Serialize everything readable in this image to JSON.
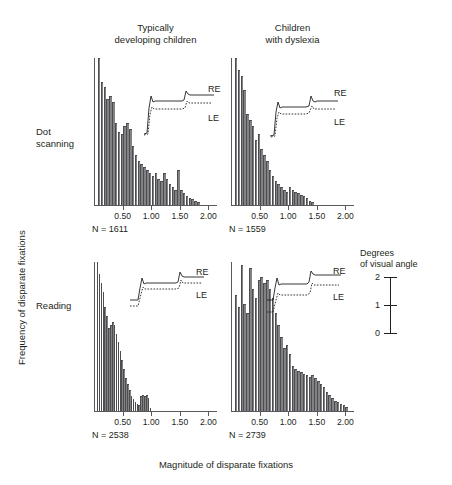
{
  "figure": {
    "y_axis_label": "Frequency of disparate fixations",
    "x_axis_label": "Magnitude of disparate fixations",
    "column_titles": [
      "Typically\ndeveloping children",
      "Children\nwith dyslexia"
    ],
    "row_labels": [
      "Dot\nscanning",
      "Reading"
    ],
    "bar_color": "#808285",
    "axis_color": "#58595b",
    "text_color": "#231f20"
  },
  "legend": {
    "title": "Degrees\nof visual angle",
    "ticks": [
      "2",
      "1",
      "0"
    ],
    "right_eye_label": "RE",
    "left_eye_label": "LE"
  },
  "chart_data": [
    {
      "type": "bar",
      "title": "Dot scanning — Typically developing children",
      "row": "Dot scanning",
      "column": "Typically developing children",
      "n_label": "N = 1611",
      "n": 1611,
      "xlabel": "Magnitude of disparate fixations",
      "ylabel": "Frequency of disparate fixations",
      "xlim": [
        0.0,
        2.15
      ],
      "xticks": [
        0.5,
        1.0,
        1.5,
        2.0
      ],
      "xticklabels": [
        "0.50",
        "1.00",
        "1.50",
        "2.00"
      ],
      "ylim": [
        0,
        100
      ],
      "grid": false,
      "bin_width": 0.05,
      "bin_starts": [
        0.05,
        0.1,
        0.15,
        0.2,
        0.25,
        0.3,
        0.35,
        0.4,
        0.45,
        0.5,
        0.55,
        0.6,
        0.65,
        0.7,
        0.75,
        0.8,
        0.85,
        0.9,
        0.95,
        1.0,
        1.05,
        1.1,
        1.15,
        1.2,
        1.25,
        1.3,
        1.35,
        1.4,
        1.45,
        1.5,
        1.55,
        1.6,
        1.65,
        1.7,
        1.75,
        1.8
      ],
      "values": [
        100,
        84,
        80,
        72,
        74,
        70,
        56,
        50,
        48,
        54,
        56,
        52,
        40,
        34,
        30,
        28,
        26,
        24,
        22,
        20,
        22,
        18,
        16,
        22,
        18,
        14,
        12,
        10,
        24,
        10,
        8,
        6,
        5,
        4,
        3,
        2
      ]
    },
    {
      "type": "bar",
      "title": "Dot scanning — Children with dyslexia",
      "row": "Dot scanning",
      "column": "Children with dyslexia",
      "n_label": "N = 1559",
      "n": 1559,
      "xlabel": "Magnitude of disparate fixations",
      "ylabel": "Frequency of disparate fixations",
      "xlim": [
        0.0,
        2.15
      ],
      "xticks": [
        0.5,
        1.0,
        1.5,
        2.0
      ],
      "xticklabels": [
        "0.50",
        "1.00",
        "1.50",
        "2.00"
      ],
      "ylim": [
        0,
        100
      ],
      "grid": false,
      "bin_width": 0.05,
      "bin_starts": [
        0.05,
        0.1,
        0.15,
        0.2,
        0.25,
        0.3,
        0.35,
        0.4,
        0.45,
        0.5,
        0.55,
        0.6,
        0.65,
        0.7,
        0.75,
        0.8,
        0.85,
        0.9,
        0.95,
        1.0,
        1.05,
        1.1,
        1.15,
        1.2,
        1.25,
        1.3,
        1.35,
        1.4
      ],
      "values": [
        100,
        92,
        88,
        78,
        62,
        58,
        54,
        44,
        48,
        38,
        34,
        30,
        24,
        20,
        16,
        14,
        12,
        10,
        9,
        12,
        10,
        9,
        8,
        7,
        6,
        5,
        3,
        2
      ]
    },
    {
      "type": "bar",
      "title": "Reading — Typically developing children",
      "row": "Reading",
      "column": "Typically developing children",
      "n_label": "N = 2538",
      "n": 2538,
      "xlabel": "Magnitude of disparate fixations",
      "ylabel": "Frequency of disparate fixations",
      "xlim": [
        0.0,
        2.15
      ],
      "xticks": [
        0.5,
        1.0,
        1.5,
        2.0
      ],
      "xticklabels": [
        "0.50",
        "1.00",
        "1.50",
        "2.00"
      ],
      "ylim": [
        0,
        100
      ],
      "grid": false,
      "bin_width": 0.033,
      "bin_starts": [
        0.033,
        0.066,
        0.1,
        0.133,
        0.166,
        0.2,
        0.233,
        0.266,
        0.3,
        0.333,
        0.366,
        0.4,
        0.433,
        0.466,
        0.5,
        0.533,
        0.566,
        0.6,
        0.633,
        0.666,
        0.7,
        0.733,
        0.766,
        0.8,
        0.833,
        0.866,
        0.9,
        0.933,
        0.966
      ],
      "values": [
        100,
        92,
        86,
        80,
        70,
        64,
        56,
        58,
        60,
        58,
        52,
        46,
        40,
        34,
        28,
        22,
        18,
        14,
        10,
        8,
        6,
        5,
        4,
        10,
        11,
        10,
        11,
        9,
        2
      ]
    },
    {
      "type": "bar",
      "title": "Reading — Children with dyslexia",
      "row": "Reading",
      "column": "Children with dyslexia",
      "n_label": "N = 2739",
      "n": 2739,
      "xlabel": "Magnitude of disparate fixations",
      "ylabel": "Frequency of disparate fixations",
      "xlim": [
        0.0,
        2.15
      ],
      "xticks": [
        0.5,
        1.0,
        1.5,
        2.0
      ],
      "xticklabels": [
        "0.50",
        "1.00",
        "1.50",
        "2.00"
      ],
      "ylim": [
        0,
        100
      ],
      "grid": false,
      "bin_width": 0.05,
      "bin_starts": [
        0.05,
        0.1,
        0.15,
        0.2,
        0.25,
        0.3,
        0.35,
        0.4,
        0.45,
        0.5,
        0.55,
        0.6,
        0.65,
        0.7,
        0.75,
        0.8,
        0.85,
        0.9,
        0.95,
        1.0,
        1.05,
        1.1,
        1.15,
        1.2,
        1.25,
        1.3,
        1.35,
        1.4,
        1.45,
        1.5,
        1.55,
        1.6,
        1.65,
        1.7,
        1.75,
        1.8,
        1.85,
        1.9,
        1.95,
        2.0
      ],
      "values": [
        78,
        70,
        98,
        72,
        66,
        96,
        82,
        76,
        88,
        90,
        86,
        88,
        82,
        76,
        66,
        58,
        50,
        42,
        44,
        38,
        30,
        28,
        27,
        26,
        25,
        24,
        23,
        24,
        22,
        20,
        18,
        16,
        13,
        11,
        9,
        7,
        6,
        5,
        4,
        3
      ]
    }
  ]
}
